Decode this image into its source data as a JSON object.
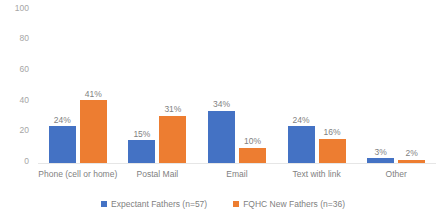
{
  "chart_data": {
    "type": "bar",
    "title": "",
    "subtitle": "",
    "xlabel": "",
    "ylabel": "",
    "ylim": [
      0,
      100
    ],
    "yticks": [
      "0",
      "20",
      "40",
      "60",
      "80",
      "100"
    ],
    "ytick_values": [
      0,
      20,
      40,
      60,
      80,
      100
    ],
    "grid": false,
    "legend_position": "bottom",
    "value_suffix": "%",
    "categories": [
      "Phone (cell or home)",
      "Postal Mail",
      "Email",
      "Text with link",
      "Other"
    ],
    "series": [
      {
        "name": "Expectant Fathers (n=57)",
        "color": "#4472C4",
        "values": [
          24,
          15,
          34,
          24,
          3
        ],
        "labels": [
          "24%",
          "15%",
          "34%",
          "24%",
          "3%"
        ]
      },
      {
        "name": "FQHC New Fathers (n=36)",
        "color": "#ED7D31",
        "values": [
          41,
          31,
          10,
          16,
          2
        ],
        "labels": [
          "41%",
          "31%",
          "10%",
          "16%",
          "2%"
        ]
      }
    ]
  },
  "axis": {
    "y_tick_0": "0",
    "y_tick_1": "20",
    "y_tick_2": "40",
    "y_tick_3": "60",
    "y_tick_4": "80",
    "y_tick_5": "100"
  },
  "colors": {
    "series_a": "#4472C4",
    "series_b": "#ED7D31",
    "text": "#7f7f7f",
    "axis_text": "#a6a6a6",
    "baseline": "#e6e6e6",
    "background": "#ffffff"
  }
}
